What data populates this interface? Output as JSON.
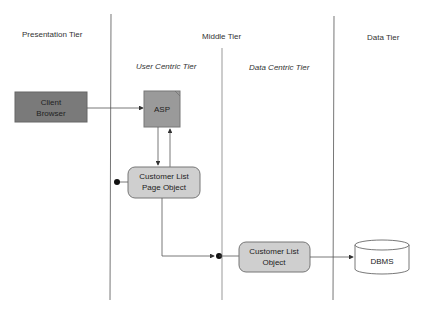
{
  "diagram": {
    "tiers": [
      {
        "label": "Presentation Tier"
      },
      {
        "label": "Middle Tier"
      },
      {
        "label": "Data Tier"
      }
    ],
    "sub_tiers": [
      {
        "label": "User Centric Tier"
      },
      {
        "label": "Data Centric Tier"
      }
    ],
    "nodes": {
      "client_browser": {
        "line1": "Client",
        "line2": "Browser"
      },
      "asp": {
        "label": "ASP"
      },
      "page_object": {
        "line1": "Customer List",
        "line2": "Page Object"
      },
      "list_object": {
        "line1": "Customer List",
        "line2": "Object"
      },
      "dbms": {
        "label": "DBMS"
      }
    },
    "colors": {
      "client_fill": "#7a7a7a",
      "asp_fill": "#9a9a9a",
      "object_fill": "#cfcfcf",
      "line": "#555555"
    }
  }
}
